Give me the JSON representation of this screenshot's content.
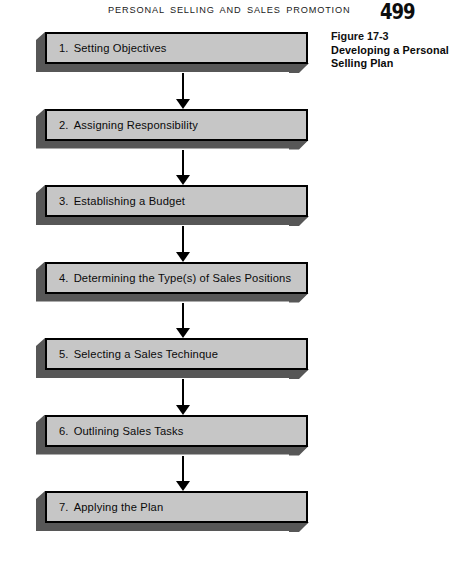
{
  "running_head": {
    "title": "PERSONAL SELLING AND SALES PROMOTION",
    "page_number": "499"
  },
  "figure": {
    "number": "Figure 17-3",
    "title_line1": "Developing a Personal",
    "title_line2": "Selling Plan"
  },
  "colors": {
    "box_face": "#c6c6c6",
    "box_border": "#000000",
    "box_extrusion": "#575757",
    "arrow": "#000000",
    "page_background": "#ffffff",
    "text": "#0a0a0a"
  },
  "chart_data": {
    "type": "diagram",
    "diagram_kind": "vertical-flowchart",
    "title": "Developing a Personal Selling Plan",
    "orientation": "top-to-bottom",
    "connector": "single-headed-arrow",
    "step_count": 7,
    "steps": [
      {
        "number": "1.",
        "label": "Setting Objectives"
      },
      {
        "number": "2.",
        "label": "Assigning Responsibility"
      },
      {
        "number": "3.",
        "label": "Establishing a Budget"
      },
      {
        "number": "4.",
        "label": "Determining the Type(s) of Sales Positions"
      },
      {
        "number": "5.",
        "label": "Selecting a Sales Techinque"
      },
      {
        "number": "6.",
        "label": "Outlining Sales Tasks"
      },
      {
        "number": "7.",
        "label": "Applying the Plan"
      }
    ]
  }
}
